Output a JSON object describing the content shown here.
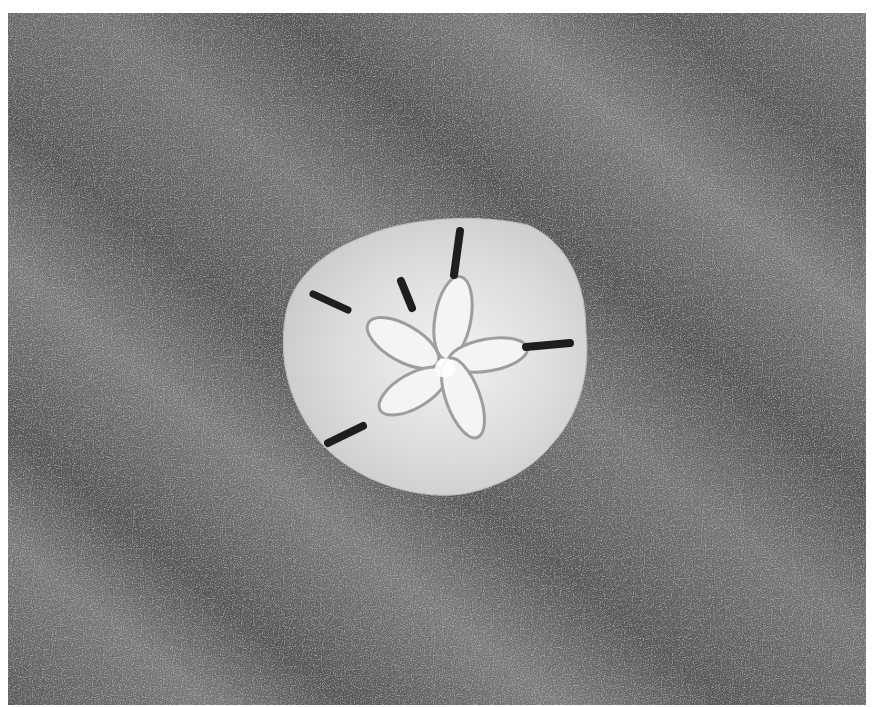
{
  "image": {
    "alt": "A sand dollar lying on rippled sand, black and white photograph",
    "subject": "sand dollar",
    "background": "rippled sand",
    "colors": {
      "sand_dark": "#5a5a5a",
      "sand_light": "#8a8a8a",
      "shell": "#d8d8d8",
      "shell_highlight": "#f4f4f4",
      "slot": "#1e1e1e"
    }
  }
}
